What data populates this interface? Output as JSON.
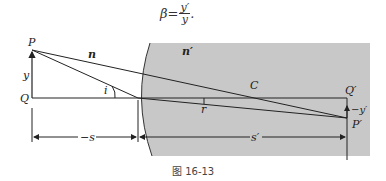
{
  "formula": {
    "lhs": "β=",
    "numerator": "y′",
    "denominator": "y",
    "trailing": "."
  },
  "figure": {
    "labels": {
      "P": "P",
      "Q": "Q",
      "y": "y",
      "n": "n",
      "n_prime": "n′",
      "i": "i",
      "r": "r",
      "C": "C",
      "Q_prime": "Q′",
      "neg_y_prime": "−y′",
      "P_prime": "P′",
      "neg_s": "−s",
      "s_prime": "s′"
    },
    "colors": {
      "medium_fill": "#c8c8c8",
      "lines": "#222222"
    }
  },
  "caption": "图 16-13"
}
